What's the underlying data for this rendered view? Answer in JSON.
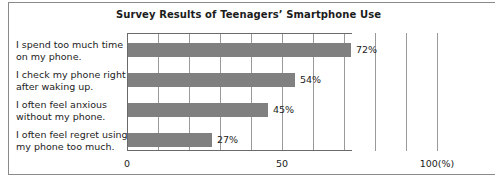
{
  "chart_data": {
    "type": "bar",
    "orientation": "horizontal",
    "title": "Survey Results of Teenagers’ Smartphone Use",
    "categories": [
      "I spend too much time on my phone.",
      "I check my phone right after waking up.",
      "I often feel anxious without my phone.",
      "I often feel regret using my phone too much."
    ],
    "values": [
      72,
      54,
      45,
      27
    ],
    "value_labels": [
      "72%",
      "54%",
      "45%",
      "27%"
    ],
    "xlabel": "",
    "ylabel": "",
    "xlim": [
      0,
      100
    ],
    "xticks": [
      0,
      50,
      100
    ],
    "xtick_labels": [
      "0",
      "50",
      "100(%)"
    ],
    "gridlines_every": 10,
    "grid": true,
    "legend": "none",
    "bar_color": "#808080",
    "grid_color": "#9a9a9a",
    "axis_color": "#6a6a6a",
    "text_color": "#1c1c1c",
    "background": "#ffffff"
  },
  "axis": {
    "unit_note": "(%)"
  }
}
